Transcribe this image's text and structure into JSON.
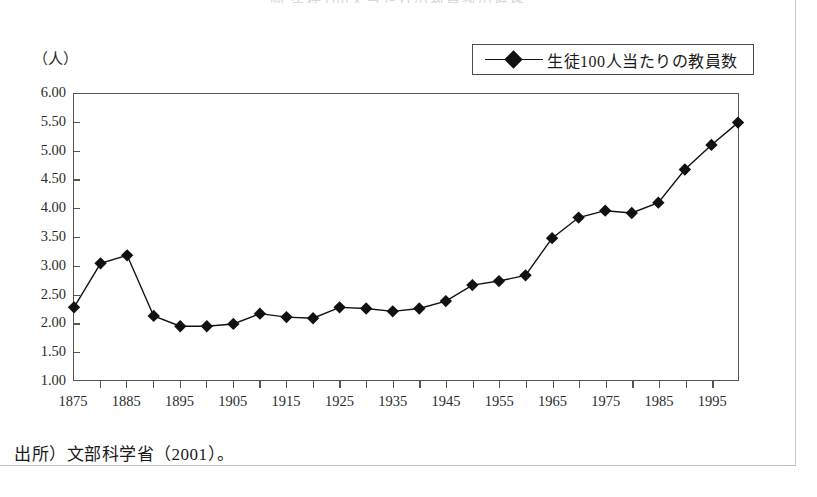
{
  "figure": {
    "title": "図 生徒100人当たりの教員数の推移",
    "unit_label": "（人）",
    "source_note": "出所）文部科学省（2001）。"
  },
  "legend": {
    "entries": [
      {
        "label": "生徒100人当たりの教員数",
        "marker": "diamond-marker",
        "color": "#111111"
      }
    ]
  },
  "axes": {
    "y_ticks": [
      "1.00",
      "1.50",
      "2.00",
      "2.50",
      "3.00",
      "3.50",
      "4.00",
      "4.50",
      "5.00",
      "5.50",
      "6.00"
    ],
    "x_ticks": [
      "1875",
      "1885",
      "1895",
      "1905",
      "1915",
      "1925",
      "1935",
      "1945",
      "1955",
      "1965",
      "1975",
      "1985",
      "1995"
    ]
  },
  "chart_data": {
    "type": "line",
    "title": "図 生徒100人当たりの教員数の推移",
    "xlabel": "",
    "ylabel": "（人）",
    "ylim": [
      1.0,
      6.0
    ],
    "xlim": [
      1875,
      2000
    ],
    "ytick_step": 0.5,
    "xtick_step": 5,
    "xlabel_step": 10,
    "grid": false,
    "legend_position": "top-right",
    "x": [
      1875,
      1880,
      1885,
      1890,
      1895,
      1900,
      1905,
      1910,
      1915,
      1920,
      1925,
      1930,
      1935,
      1940,
      1945,
      1950,
      1955,
      1960,
      1965,
      1970,
      1975,
      1980,
      1985,
      1990,
      1995,
      2000
    ],
    "series": [
      {
        "name": "生徒100人当たりの教員数",
        "marker": "diamond",
        "color": "#111111",
        "values": [
          2.27,
          3.04,
          3.18,
          2.12,
          1.94,
          1.94,
          1.98,
          2.16,
          2.1,
          2.08,
          2.27,
          2.25,
          2.2,
          2.25,
          2.38,
          2.66,
          2.73,
          2.83,
          3.48,
          3.84,
          3.96,
          3.92,
          4.1,
          4.68,
          5.11,
          5.5
        ]
      }
    ]
  }
}
